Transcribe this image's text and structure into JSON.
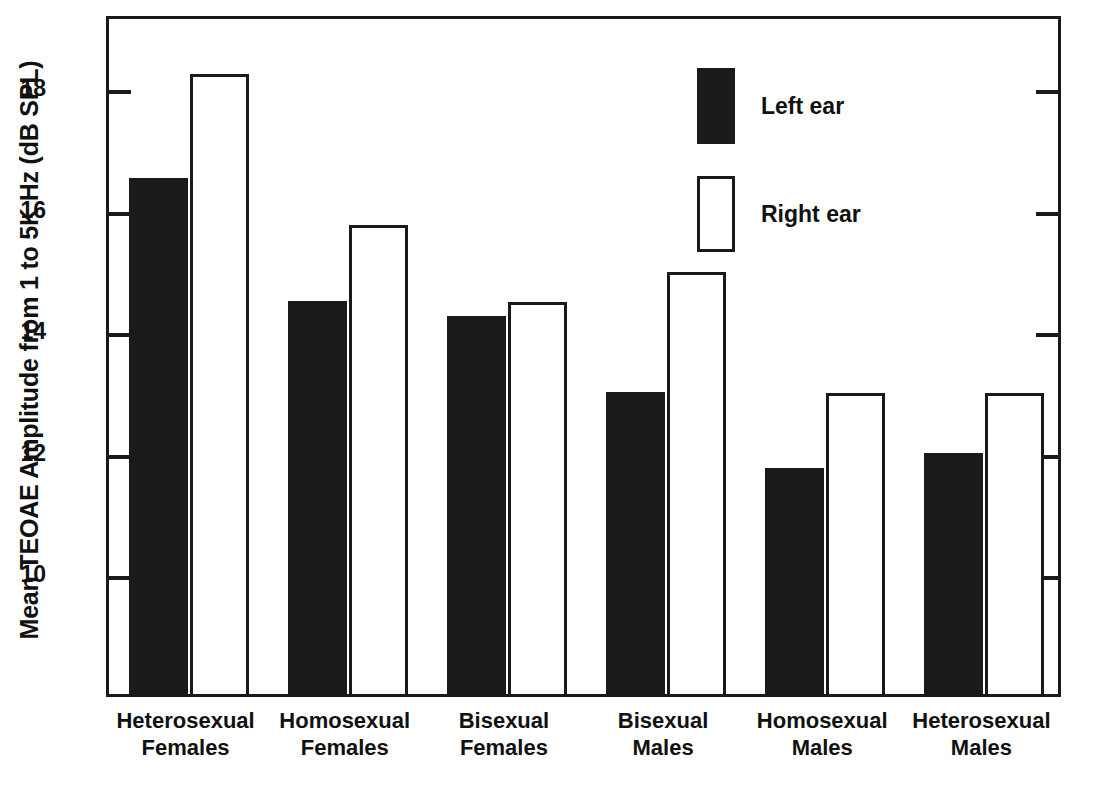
{
  "chart_data": {
    "type": "bar",
    "title": "",
    "xlabel": "",
    "ylabel": "Mean TEOAE Amplitude from 1 to 5K Hz (dB SPL)",
    "categories": [
      "Heterosexual\nFemales",
      "Homosexual\nFemales",
      "Bisexual\nFemales",
      "Bisexual\nMales",
      "Homosexual\nMales",
      "Heterosexual\nMales"
    ],
    "series": [
      {
        "name": "Left ear",
        "color": "#1a1a1a",
        "style": "filled",
        "values": [
          16.48,
          14.47,
          14.21,
          12.97,
          11.71,
          11.97
        ]
      },
      {
        "name": "Right ear",
        "color": "#ffffff",
        "style": "open",
        "values": [
          18.2,
          15.71,
          14.44,
          14.94,
          12.95,
          12.95
        ]
      }
    ],
    "ylim": [
      8.0,
      19.2
    ],
    "yticks": [
      10,
      12,
      14,
      16,
      18
    ],
    "ytick_labels": [
      "10",
      "12",
      "14",
      "16",
      "18"
    ],
    "grid": false,
    "legend_position": "top-right",
    "legend": [
      {
        "label": "Left ear",
        "swatch": "filled"
      },
      {
        "label": "Right ear",
        "swatch": "open"
      }
    ]
  }
}
